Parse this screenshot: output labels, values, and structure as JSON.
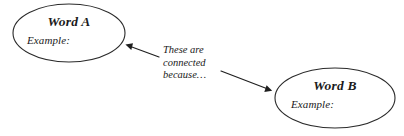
{
  "diagram": {
    "type": "word-connection-graphic-organizer",
    "background_color": "#ffffff",
    "stroke_color": "#2a2a2a",
    "text_color": "#1a1a1a",
    "nodes": [
      {
        "id": "word-a",
        "title": "Word A",
        "example": "Example:",
        "shape": "ellipse",
        "cx": 69,
        "cy": 33,
        "rx": 56,
        "ry": 29
      },
      {
        "id": "word-b",
        "title": "Word B",
        "example": "Example:",
        "shape": "ellipse",
        "cx": 335,
        "cy": 98,
        "rx": 60,
        "ry": 30
      }
    ],
    "annotation": {
      "text": "These are\nconnected\nbecause…",
      "lines": [
        "These are",
        "connected",
        "because…"
      ]
    },
    "arrows": [
      {
        "id": "arrow-to-word-a",
        "direction": "up-left",
        "from_x": 159,
        "from_y": 57,
        "to_x": 126,
        "to_y": 45
      },
      {
        "id": "arrow-to-word-b",
        "direction": "down-right",
        "from_x": 221,
        "from_y": 71,
        "to_x": 272,
        "to_y": 91
      }
    ]
  }
}
